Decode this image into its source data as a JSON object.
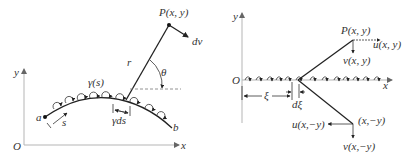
{
  "left_panel": {
    "axes": {
      "x_label": "x",
      "y_label": "y",
      "origin_label": "O"
    },
    "curve": {
      "start_label": "a",
      "end_label": "b",
      "arclength_label": "s"
    },
    "vortex_strength_label": "γ(s)",
    "element_strength_label": "γds",
    "point_label": "P(x, y)",
    "radius_label": "r",
    "angle_label": "θ",
    "induced_velocity_label": "dv"
  },
  "right_panel": {
    "axes": {
      "x_label": "x",
      "y_label": "y",
      "origin_label": "O"
    },
    "position_label": "ξ",
    "element_label": "dξ",
    "upper_point_label": "P(x, y)",
    "upper_u_label": "u(x, y)",
    "upper_v_label": "v(x, y)",
    "lower_point_label": "(x,−y)",
    "lower_u_label": "u(x,−y)",
    "lower_v_label": "v(x,−y)"
  },
  "colors": {
    "line": "#222222",
    "axis": "#b5b5b5",
    "text": "#333333"
  }
}
